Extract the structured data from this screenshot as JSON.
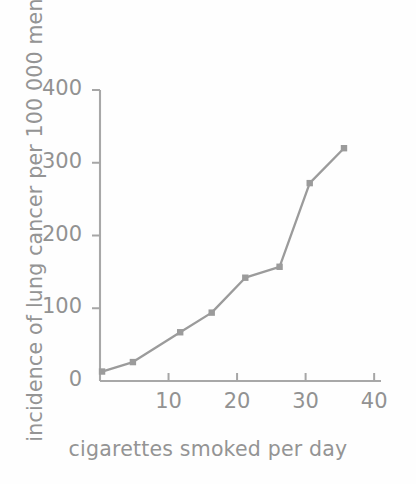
{
  "chart_data": {
    "type": "line",
    "title": "",
    "subtitle": "",
    "xlabel": "cigarettes smoked per day",
    "ylabel": "incidence of lung cancer per 100 000 men",
    "xlim": [
      0,
      41
    ],
    "ylim": [
      0,
      400
    ],
    "xticks": [
      10,
      20,
      30,
      40
    ],
    "yticks": [
      0,
      100,
      200,
      300,
      400
    ],
    "xtick_labels": [
      "10",
      "20",
      "30",
      "40"
    ],
    "ytick_labels": [
      "0",
      "100",
      "200",
      "300",
      "400"
    ],
    "grid": false,
    "legend": false,
    "legend_position": "none",
    "marker": "square",
    "series": [
      {
        "name": "lung cancer incidence",
        "color": "#9b9b9b",
        "x": [
          0.3,
          4.8,
          11.7,
          16.3,
          21.2,
          26.2,
          30.6,
          35.6
        ],
        "y": [
          13,
          26,
          67,
          94,
          142,
          157,
          272,
          320
        ],
        "points": [
          {
            "x": 0.3,
            "y": 13
          },
          {
            "x": 4.8,
            "y": 26
          },
          {
            "x": 11.7,
            "y": 67
          },
          {
            "x": 16.3,
            "y": 94
          },
          {
            "x": 21.2,
            "y": 142
          },
          {
            "x": 26.2,
            "y": 157
          },
          {
            "x": 30.6,
            "y": 272
          },
          {
            "x": 35.6,
            "y": 320
          }
        ]
      }
    ]
  },
  "axes": {
    "line_color": "#a6a6a6",
    "text_color": "#929292"
  },
  "icons": {
    "plot_name": "line-chart"
  }
}
